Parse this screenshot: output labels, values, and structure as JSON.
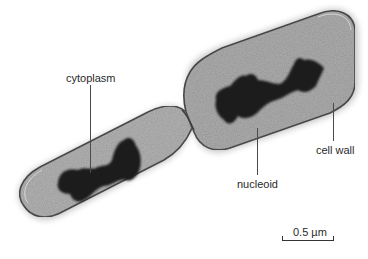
{
  "figure": {
    "labels": {
      "cytoplasm": "cytoplasm",
      "nucleoid": "nucleoid",
      "cell_wall": "cell wall"
    },
    "scale_bar": {
      "text": "0.5 µm"
    },
    "colors": {
      "background": "#ffffff",
      "cell_fill": "#a9a9a9",
      "cell_wall": "#555555",
      "nucleoid": "#1e1e1e",
      "label_text": "#2a2a2a"
    }
  }
}
